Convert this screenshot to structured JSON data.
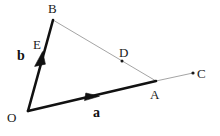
{
  "figure": {
    "kind": "vector-geometry-diagram",
    "width": 220,
    "height": 136,
    "background_color": "#ffffff"
  },
  "colors": {
    "vector_stroke": "#111111",
    "thin_line_stroke": "#9a9a9a",
    "point_dot": "#1a1a1a",
    "label_text": "#1a1a1a",
    "vector_label_text": "#111111"
  },
  "points": {
    "O": {
      "label": "O",
      "x": 28,
      "y": 111,
      "label_x": 12,
      "label_y": 118,
      "dot": false
    },
    "B": {
      "label": "B",
      "x": 53,
      "y": 20,
      "label_x": 53,
      "label_y": 9,
      "dot": false
    },
    "A": {
      "label": "A",
      "x": 156,
      "y": 81,
      "label_x": 155,
      "label_y": 95,
      "dot": false
    },
    "C": {
      "label": "C",
      "x": 193,
      "y": 73,
      "label_x": 201,
      "label_y": 74,
      "dot": true
    },
    "D": {
      "label": "D",
      "x": 122,
      "y": 61,
      "label_x": 124,
      "label_y": 53,
      "dot": true
    },
    "E": {
      "label": "E",
      "x": 41,
      "y": 52,
      "label_x": 38,
      "label_y": 45,
      "dot": false
    }
  },
  "vectors": [
    {
      "name": "vector-a",
      "label": "a",
      "from": "O",
      "to": "A",
      "x1": 28,
      "y1": 111,
      "x2": 156,
      "y2": 81,
      "stroke_width": 2.6,
      "arrow_at": {
        "x": 95,
        "y": 96
      },
      "label_x": 98,
      "label_y": 113
    },
    {
      "name": "vector-b",
      "label": "b",
      "from": "O",
      "to": "B",
      "x1": 28,
      "y1": 111,
      "x2": 53,
      "y2": 20,
      "stroke_width": 2.6,
      "arrow_at": {
        "x": 41,
        "y": 56
      },
      "label_x": 23,
      "label_y": 56
    }
  ],
  "thin_lines": [
    {
      "name": "line-B-to-A",
      "from": "B",
      "to": "A",
      "x1": 53,
      "y1": 20,
      "x2": 156,
      "y2": 81,
      "stroke_width": 0.9
    },
    {
      "name": "line-A-to-C",
      "from": "A",
      "to": "C",
      "x1": 156,
      "y1": 81,
      "x2": 193,
      "y2": 73,
      "stroke_width": 0.9
    }
  ]
}
